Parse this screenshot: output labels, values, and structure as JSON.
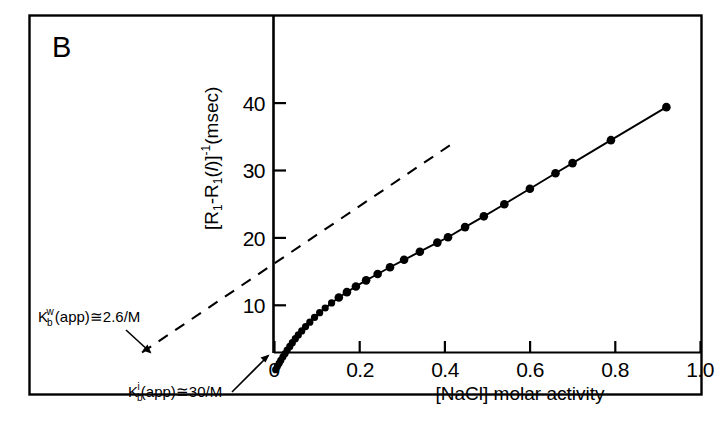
{
  "figure": {
    "panel_label": "B",
    "border_color": "#000000",
    "background_color": "#ffffff",
    "ink_color": "#000000"
  },
  "annotations": [
    {
      "name": "kbw-annotation",
      "base": "K",
      "subscript": "b",
      "superscript": "w",
      "rest": "(app)≅2.6/M",
      "full_text": "K_b^w(app) ≅ 2.6/M"
    },
    {
      "name": "kbi-annotation",
      "base": "K",
      "subscript": "b",
      "superscript": "i",
      "rest": "(app)≅30/M",
      "full_text": "K_b^i(app) ≅ 30/M"
    }
  ],
  "chart_data": {
    "type": "scatter",
    "title": "B",
    "xlabel": "[NaCl] molar activity",
    "ylabel": "[R₁-R₁(/)]⁻¹ (msec)",
    "ylabel_parts": {
      "open_bracket": "[",
      "r_one": "R",
      "sub_one": "1",
      "minus": "-",
      "r_one_b": "R",
      "sub_one_b": "1",
      "paren_open": "(",
      "italic_l": "l",
      "paren_close": ")",
      "close_bracket": "]",
      "exponent": "-1",
      "units": "(msec)"
    },
    "xlim": [
      -0.03,
      1.0
    ],
    "ylim": [
      0,
      50
    ],
    "xticks": [
      0,
      0.2,
      0.4,
      0.6,
      0.8,
      1.0
    ],
    "xtick_labels": [
      "0",
      "0.2",
      "0.4",
      "0.6",
      "0.8",
      "1.0"
    ],
    "yticks": [
      10,
      20,
      30,
      40
    ],
    "ytick_labels": [
      "10",
      "20",
      "30",
      "40"
    ],
    "grid": false,
    "legend": null,
    "series": [
      {
        "name": "measured",
        "style": "solid-line-with-filled-circles",
        "marker": "filled-circle",
        "points": [
          [
            0.004,
            0.45
          ],
          [
            0.008,
            0.95
          ],
          [
            0.012,
            1.4
          ],
          [
            0.016,
            1.85
          ],
          [
            0.021,
            2.35
          ],
          [
            0.026,
            2.85
          ],
          [
            0.031,
            3.35
          ],
          [
            0.037,
            3.9
          ],
          [
            0.043,
            4.45
          ],
          [
            0.05,
            5.05
          ],
          [
            0.057,
            5.6
          ],
          [
            0.065,
            6.2
          ],
          [
            0.074,
            6.85
          ],
          [
            0.084,
            7.5
          ],
          [
            0.095,
            8.2
          ],
          [
            0.107,
            8.9
          ],
          [
            0.12,
            9.6
          ],
          [
            0.135,
            10.35
          ],
          [
            0.152,
            11.15
          ],
          [
            0.171,
            11.95
          ],
          [
            0.192,
            12.8
          ],
          [
            0.216,
            13.7
          ],
          [
            0.243,
            14.65
          ],
          [
            0.272,
            15.65
          ],
          [
            0.305,
            16.75
          ],
          [
            0.342,
            17.95
          ],
          [
            0.383,
            19.3
          ],
          [
            0.408,
            20.1
          ],
          [
            0.448,
            21.6
          ],
          [
            0.492,
            23.2
          ],
          [
            0.54,
            25.0
          ],
          [
            0.6,
            27.3
          ],
          [
            0.66,
            29.6
          ],
          [
            0.7,
            31.1
          ],
          [
            0.79,
            34.5
          ],
          [
            0.92,
            39.4
          ]
        ]
      },
      {
        "name": "limiting-tangent",
        "style": "dashed-line",
        "x_intercept": -0.31,
        "y_intercept": 13.1,
        "x_end": 0.43,
        "y_end": 31.4
      }
    ]
  }
}
